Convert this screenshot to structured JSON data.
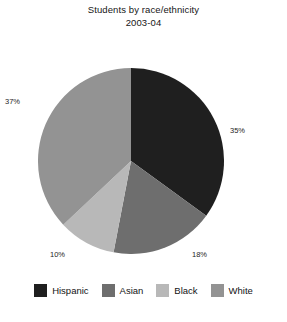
{
  "chart_data": {
    "type": "pie",
    "title": "Students by race/ethnicity",
    "subtitle": "2003-04",
    "xlabel": "",
    "ylabel": "",
    "legend_position": "bottom",
    "grid": false,
    "start_angle_deg": 0,
    "direction": "clockwise",
    "categories": [
      "Hispanic",
      "Asian",
      "Black",
      "White"
    ],
    "values": [
      35,
      18,
      10,
      37
    ],
    "value_unit": "%",
    "data_labels": [
      "35%",
      "18%",
      "10%",
      "37%"
    ],
    "colors": [
      "#1f1f1f",
      "#6e6e6e",
      "#b8b8b8",
      "#939393"
    ],
    "slices": [
      {
        "label": "Hispanic",
        "value": 35,
        "display": "35%",
        "color": "#1f1f1f"
      },
      {
        "label": "Asian",
        "value": 18,
        "display": "18%",
        "color": "#6e6e6e"
      },
      {
        "label": "Black",
        "value": 10,
        "display": "10%",
        "color": "#b8b8b8"
      },
      {
        "label": "White",
        "value": 37,
        "display": "37%",
        "color": "#939393"
      }
    ]
  },
  "legend": {
    "items": [
      {
        "label": "Hispanic",
        "color": "#1f1f1f"
      },
      {
        "label": "Asian",
        "color": "#6e6e6e"
      },
      {
        "label": "Black",
        "color": "#b8b8b8"
      },
      {
        "label": "White",
        "color": "#939393"
      }
    ]
  },
  "footer": {
    "fragment": ""
  }
}
